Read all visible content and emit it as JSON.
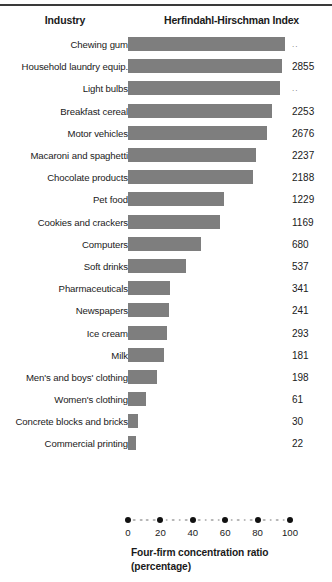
{
  "header": {
    "col_industry": "Industry",
    "col_index": "Herfindahl-Hirschman Index"
  },
  "axis": {
    "caption_line1": "Four-firm concentration ratio",
    "caption_line2": "(percentage)",
    "ticks": [
      0,
      20,
      40,
      60,
      80,
      100
    ],
    "tick_labels": [
      "0",
      "20",
      "40",
      "60",
      "80",
      "100"
    ],
    "minor_step": 4
  },
  "colors": {
    "bar_fill": "#7e7e7e",
    "text": "#1a1a1a",
    "axis_dot_major": "#111111",
    "axis_dot_minor": "#b6b6b6",
    "rule": "#3a3a3a"
  },
  "chart_data": {
    "type": "bar",
    "orientation": "horizontal",
    "title": "",
    "xlabel": "Four-firm concentration ratio (percentage)",
    "ylabel": "Industry",
    "xlim": [
      0,
      100
    ],
    "grid": false,
    "legend": "none",
    "categories": [
      "Chewing gum",
      "Household laundry equip.",
      "Light bulbs",
      "Breakfast cereal",
      "Motor vehicles",
      "Macaroni and spaghetti",
      "Chocolate products",
      "Pet food",
      "Cookies and crackers",
      "Computers",
      "Soft drinks",
      "Pharmaceuticals",
      "Newspapers",
      "Ice cream",
      "Milk",
      "Men's and boys' clothing",
      "Women's clothing",
      "Concrete blocks and bricks",
      "Commercial printing"
    ],
    "values": [
      97,
      95,
      94,
      89,
      86,
      79,
      77,
      59,
      57,
      45,
      36,
      26,
      25,
      24,
      22,
      18,
      11,
      6,
      5
    ],
    "value_labels": [
      "..",
      "2855",
      "..",
      "2253",
      "2676",
      "2237",
      "2188",
      "1229",
      "1169",
      "680",
      "537",
      "341",
      "241",
      "293",
      "181",
      "198",
      "61",
      "30",
      "22"
    ],
    "series": [
      {
        "name": "Four-firm concentration ratio",
        "values": [
          97,
          95,
          94,
          89,
          86,
          79,
          77,
          59,
          57,
          45,
          36,
          26,
          25,
          24,
          22,
          18,
          11,
          6,
          5
        ]
      },
      {
        "name": "Herfindahl-Hirschman Index",
        "values": [
          null,
          2855,
          null,
          2253,
          2676,
          2237,
          2188,
          1229,
          1169,
          680,
          537,
          341,
          241,
          293,
          181,
          198,
          61,
          30,
          22
        ]
      }
    ]
  }
}
